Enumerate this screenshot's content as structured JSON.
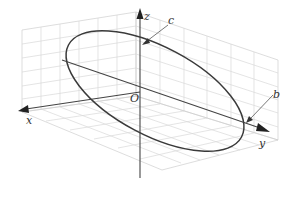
{
  "figure": {
    "type": "3d-ellipse-diagram",
    "axes": {
      "x_label": "x",
      "y_label": "y",
      "z_label": "z",
      "origin_label": "O"
    },
    "annotations": {
      "c_label": "c",
      "b_label": "b"
    },
    "colors": {
      "grid": "#d6d6d6",
      "axis": "#444444",
      "ellipse": "#3a3a3a",
      "background": "#ffffff"
    }
  }
}
